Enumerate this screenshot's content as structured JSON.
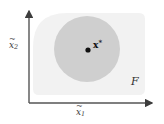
{
  "figure": {
    "type": "diagram"
  },
  "axes": {
    "x_label_base": "x",
    "x_label_sub": "1",
    "y_label_base": "x",
    "y_label_sub": "2",
    "x_axis_name": "x-tilde-1",
    "y_axis_name": "x-tilde-2",
    "axis_color": "#555555",
    "origin": {
      "x": 29,
      "y": 103
    },
    "x_axis_end": {
      "x": 156,
      "y": 103
    },
    "y_axis_end": {
      "x": 29,
      "y": 8
    }
  },
  "shapes": {
    "feasible_region": {
      "label": "F",
      "label_name": "script-F",
      "fill": "#f2f2f2",
      "x": 33,
      "y": 13,
      "width": 112,
      "height": 82,
      "corner_radius_top_left": 34,
      "corner_radius_other": 6
    },
    "level_set_disk": {
      "fill": "#cfcfcf",
      "center_x": 87,
      "center_y": 49,
      "radius": 33
    },
    "optimum_point": {
      "label_base": "x",
      "label_sup": "*",
      "marker_color": "#111111",
      "cx": 88,
      "cy": 50,
      "r": 2.6
    }
  }
}
